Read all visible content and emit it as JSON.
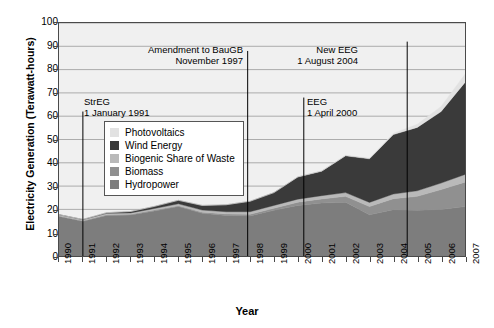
{
  "chart_data": {
    "type": "area",
    "title": "",
    "xlabel": "Year",
    "ylabel": "Electricity Generation (Terawatt-hours)",
    "xlim": [
      1990,
      2007
    ],
    "ylim": [
      0,
      100
    ],
    "ytick_step": 10,
    "grid": true,
    "stacked": true,
    "legend_position": "inside-upper-left",
    "categories": [
      1990,
      1991,
      1992,
      1993,
      1994,
      1995,
      1996,
      1997,
      1998,
      1999,
      2000,
      2001,
      2002,
      2003,
      2004,
      2005,
      2006,
      2007
    ],
    "xtick_labels": [
      "1990",
      "1991",
      "1992",
      "1993",
      "1994",
      "1995",
      "1996",
      "1997",
      "1998",
      "1999",
      "2000",
      "2001",
      "2002",
      "2003",
      "2004",
      "2005",
      "2006",
      "2007"
    ],
    "ytick_labels": [
      "0",
      "10",
      "20",
      "30",
      "40",
      "50",
      "60",
      "70",
      "80",
      "90",
      "100"
    ],
    "series": [
      {
        "name": "Hydropower",
        "color": "#7d7d7d",
        "values": [
          17.0,
          14.9,
          17.4,
          17.6,
          19.3,
          21.2,
          18.3,
          17.4,
          17.2,
          19.6,
          21.7,
          22.7,
          23.1,
          17.7,
          19.9,
          19.6,
          20.0,
          21.2
        ]
      },
      {
        "name": "Biomass",
        "color": "#909090",
        "values": [
          0.2,
          0.2,
          0.3,
          0.3,
          0.4,
          0.4,
          0.5,
          0.6,
          0.7,
          0.9,
          1.4,
          1.8,
          2.5,
          3.5,
          4.7,
          6.0,
          8.5,
          10.5
        ]
      },
      {
        "name": "Biogenic Share of Waste",
        "color": "#b9b9b9",
        "values": [
          0.5,
          0.5,
          0.6,
          0.6,
          0.7,
          0.8,
          0.9,
          1.0,
          1.1,
          1.2,
          1.3,
          1.4,
          1.6,
          1.8,
          2.0,
          2.4,
          2.8,
          3.3
        ]
      },
      {
        "name": "Wind Energy",
        "color": "#3a3a3a",
        "values": [
          0.07,
          0.1,
          0.3,
          0.6,
          0.9,
          1.5,
          2.0,
          3.0,
          4.5,
          5.5,
          9.5,
          10.5,
          15.8,
          18.7,
          25.5,
          27.2,
          30.7,
          39.5
        ]
      },
      {
        "name": "Photovoltaics",
        "color": "#e2e2e2",
        "values": [
          0.0,
          0.0,
          0.0,
          0.0,
          0.0,
          0.0,
          0.0,
          0.0,
          0.0,
          0.0,
          0.1,
          0.1,
          0.2,
          0.3,
          0.6,
          1.3,
          2.2,
          3.5
        ]
      }
    ],
    "totals": [
      17.8,
      15.7,
      18.6,
      19.1,
      21.3,
      23.9,
      21.7,
      22.0,
      23.5,
      27.2,
      34.0,
      36.5,
      43.2,
      42.0,
      52.7,
      56.5,
      64.2,
      78.0
    ],
    "annotations": [
      {
        "label": "StrEG",
        "date": "1 January 1991",
        "x": 1991
      },
      {
        "label": "Amendment to BauGB",
        "date": "November 1997",
        "x": 1997.9
      },
      {
        "label": "EEG",
        "date": "1 April 2000",
        "x": 2000.25
      },
      {
        "label": "New EEG",
        "date": "1 August 2004",
        "x": 2004.58
      }
    ]
  },
  "legend": {
    "items": [
      {
        "label": "Photovoltaics",
        "color": "#e2e2e2"
      },
      {
        "label": "Wind Energy",
        "color": "#3a3a3a"
      },
      {
        "label": "Biogenic Share of Waste",
        "color": "#b9b9b9"
      },
      {
        "label": "Biomass",
        "color": "#909090"
      },
      {
        "label": "Hydropower",
        "color": "#7d7d7d"
      }
    ]
  },
  "style": {
    "plot_background": "#f0f0f0",
    "grid_color": "#9a9a9a",
    "axis_color": "#4a4a4a",
    "annotation_line_color": "#000000"
  }
}
